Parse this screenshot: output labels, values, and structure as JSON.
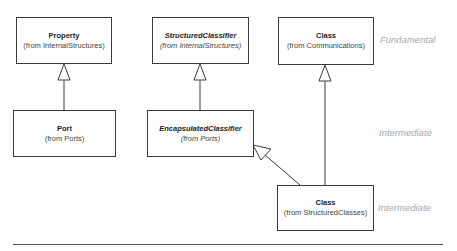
{
  "diagram": {
    "type": "UML class diagram",
    "classes": [
      {
        "id": "property",
        "name": "Property",
        "from": "(from InternalStructures)",
        "abstract": false
      },
      {
        "id": "structured-classifier",
        "name": "StructuredClassifier",
        "from": "(from InternalStructures)",
        "abstract": true
      },
      {
        "id": "class-communications",
        "name": "Class",
        "from": "(from Communications)",
        "abstract": false
      },
      {
        "id": "port",
        "name": "Port",
        "from": "(from Ports)",
        "abstract": false
      },
      {
        "id": "encapsulated-classifier",
        "name": "EncapsulatedClassifier",
        "from": "(from Ports)",
        "abstract": true
      },
      {
        "id": "class-structured",
        "name": "Class",
        "from": "(from StructuredClasses)",
        "abstract": false
      }
    ],
    "generalizations": [
      {
        "child": "port",
        "parent": "property"
      },
      {
        "child": "encapsulated-classifier",
        "parent": "structured-classifier"
      },
      {
        "child": "class-structured",
        "parent": "encapsulated-classifier"
      },
      {
        "child": "class-structured",
        "parent": "class-communications"
      }
    ],
    "levels": [
      {
        "label": "Fundamental"
      },
      {
        "label": "Intermediate"
      },
      {
        "label": "Intermediate"
      }
    ],
    "colors": {
      "line": "#3a3a3a",
      "level_text": "#a8a8a8"
    }
  }
}
